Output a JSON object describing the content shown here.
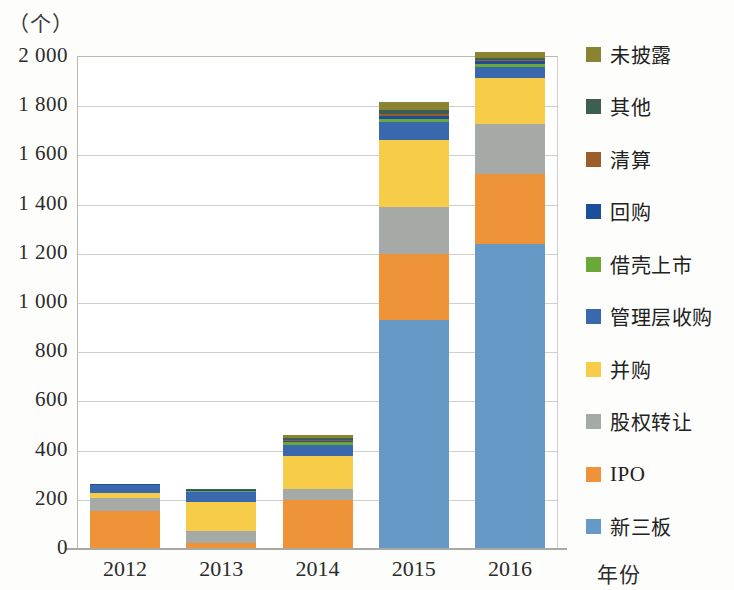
{
  "chart_data": {
    "type": "bar",
    "stacked": true,
    "title": "",
    "unit_label": "（个）",
    "xlabel": "年份",
    "ylabel": "",
    "categories": [
      "2012",
      "2013",
      "2014",
      "2015",
      "2016"
    ],
    "ylim": [
      0,
      2000
    ],
    "yticks": [
      "0",
      "200",
      "400",
      "600",
      "800",
      "1 000",
      "1 200",
      "1 400",
      "1 600",
      "1 800",
      "2 000"
    ],
    "ytick_values": [
      0,
      200,
      400,
      600,
      800,
      1000,
      1200,
      1400,
      1600,
      1800,
      2000
    ],
    "grid": true,
    "legend_position": "right",
    "series": [
      {
        "name": "新三板",
        "color": "#6699c6",
        "values": [
          0,
          0,
          0,
          925,
          1235
        ]
      },
      {
        "name": "IPO",
        "color": "#ef9338",
        "values": [
          150,
          22,
          195,
          270,
          285
        ]
      },
      {
        "name": "股权转让",
        "color": "#a6aaa6",
        "values": [
          55,
          48,
          45,
          190,
          205
        ]
      },
      {
        "name": "并购",
        "color": "#f7cc49",
        "values": [
          20,
          118,
          135,
          275,
          185
        ]
      },
      {
        "name": "管理层收购",
        "color": "#3a68ac",
        "values": [
          30,
          40,
          42,
          70,
          45
        ]
      },
      {
        "name": "借壳上市",
        "color": "#6aa83a",
        "values": [
          3,
          4,
          14,
          16,
          14
        ]
      },
      {
        "name": "回购",
        "color": "#1b4f9c",
        "values": [
          2,
          3,
          5,
          10,
          9
        ]
      },
      {
        "name": "清算",
        "color": "#9b5e2b",
        "values": [
          1,
          2,
          4,
          7,
          6
        ]
      },
      {
        "name": "其他",
        "color": "#3d5e53",
        "values": [
          1,
          2,
          6,
          17,
          9
        ]
      },
      {
        "name": "未披露",
        "color": "#8a8332",
        "values": [
          0,
          1,
          14,
          35,
          22
        ]
      }
    ],
    "totals": [
      262,
      240,
      460,
      1815,
      2015
    ],
    "legend_entries": [
      {
        "label": "未披露",
        "color": "#8a8332",
        "latin": false
      },
      {
        "label": "其他",
        "color": "#3d5e53",
        "latin": false
      },
      {
        "label": "清算",
        "color": "#9b5e2b",
        "latin": false
      },
      {
        "label": "回购",
        "color": "#1b4f9c",
        "latin": false
      },
      {
        "label": "借壳上市",
        "color": "#6aa83a",
        "latin": false
      },
      {
        "label": "管理层收购",
        "color": "#3a68ac",
        "latin": false
      },
      {
        "label": "并购",
        "color": "#f7cc49",
        "latin": false
      },
      {
        "label": "股权转让",
        "color": "#a6aaa6",
        "latin": false
      },
      {
        "label": "IPO",
        "color": "#ef9338",
        "latin": true
      },
      {
        "label": "新三板",
        "color": "#6699c6",
        "latin": false
      }
    ]
  }
}
